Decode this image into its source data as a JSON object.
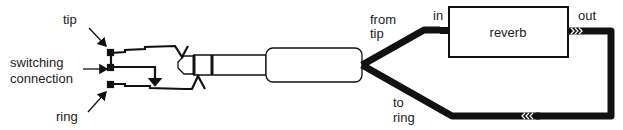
{
  "diagram": {
    "type": "insert-cable-wiring",
    "labels": {
      "tip": "tip",
      "switching_line1": "switching",
      "switching_line2": "connection",
      "ring": "ring",
      "from_line1": "from",
      "from_line2": "tip",
      "to_line1": "to",
      "to_line2": "ring",
      "in": "in",
      "out": "out",
      "reverb": "reverb"
    },
    "colors": {
      "stroke": "#111111",
      "text": "#222222",
      "background": "#ffffff"
    }
  }
}
